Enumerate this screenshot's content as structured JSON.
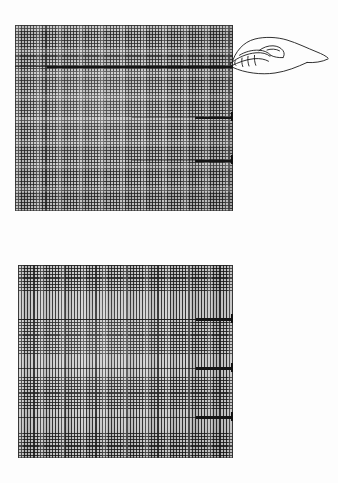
{
  "document": {
    "kind": "scanned-figure-plate",
    "background_color": "#fdfdfd",
    "width": 338,
    "height": 483,
    "caption_top": "",
    "caption_bottom": ""
  },
  "figures": [
    {
      "id": "figure-top",
      "label": "",
      "swatch": {
        "name": "woven-mesh-swatch-full",
        "description": "dense cross-woven grid, horizontal and vertical threads throughout",
        "x": 15,
        "y": 25,
        "width": 218,
        "height": 186,
        "base_color": "#c2c2c2",
        "thread_color": "#1e1e1e",
        "pitch_px": 3.05
      },
      "markers": [
        {
          "name": "marker-line-1",
          "type": "pointer-target",
          "x": 47,
          "y": 66,
          "width": 186,
          "height": 2,
          "color": "#141414"
        },
        {
          "name": "marker-line-2",
          "type": "defect-mark",
          "x": 195,
          "y": 117,
          "width": 38,
          "height": 2,
          "color": "#141414"
        },
        {
          "name": "marker-line-3",
          "type": "defect-mark",
          "x": 195,
          "y": 160,
          "width": 38,
          "height": 2,
          "color": "#141414"
        }
      ],
      "rules": [
        {
          "name": "faint-rule-1",
          "x": 15,
          "y": 66,
          "width": 218
        },
        {
          "name": "faint-rule-2",
          "x": 132,
          "y": 117,
          "width": 101
        },
        {
          "name": "faint-rule-3",
          "x": 132,
          "y": 160,
          "width": 101
        }
      ],
      "pointer": {
        "name": "hand-pointing-illustration",
        "style": "ink line drawing",
        "x": 231,
        "y": 30,
        "width": 92,
        "height": 58,
        "fingertip_x": 233,
        "fingertip_y": 66,
        "stroke_color": "#1a1a1a"
      }
    },
    {
      "id": "figure-bottom",
      "label": "",
      "swatch": {
        "name": "woven-mesh-swatch-banded",
        "description": "vertical threads continuous; horizontal threads present only in banded rows",
        "x": 18,
        "y": 265,
        "width": 215,
        "height": 193,
        "base_color": "#c9c9c9",
        "thread_color": "#191919",
        "pitch_px": 3.1,
        "bands": [
          {
            "name": "weave-band-1",
            "top": 0,
            "height": 28
          },
          {
            "name": "weave-band-2",
            "top": 54,
            "height": 36
          },
          {
            "name": "weave-band-3",
            "top": 112,
            "height": 32
          },
          {
            "name": "weave-band-4",
            "top": 168,
            "height": 25
          }
        ]
      },
      "markers": [
        {
          "name": "marker-line-1",
          "type": "defect-mark",
          "x": 196,
          "y": 319,
          "width": 37,
          "height": 2,
          "color": "#141414"
        },
        {
          "name": "marker-line-2",
          "type": "defect-mark",
          "x": 196,
          "y": 368,
          "width": 37,
          "height": 2,
          "color": "#141414"
        },
        {
          "name": "marker-line-3",
          "type": "defect-mark",
          "x": 196,
          "y": 417,
          "width": 37,
          "height": 2,
          "color": "#141414"
        }
      ],
      "rules": [
        {
          "name": "faint-rule-1",
          "x": 18,
          "y": 319,
          "width": 215
        },
        {
          "name": "faint-rule-2",
          "x": 18,
          "y": 368,
          "width": 215
        },
        {
          "name": "faint-rule-3",
          "x": 18,
          "y": 417,
          "width": 215
        }
      ],
      "pointer": null
    }
  ]
}
